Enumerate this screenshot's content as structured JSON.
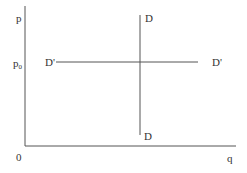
{
  "diagram": {
    "axes": {
      "y_label": "p",
      "x_label": "q",
      "origin_label": "0",
      "y_tick_label": "p",
      "y_tick_subscript": "0"
    },
    "curves": {
      "vertical_demand": {
        "top_label": "D",
        "bottom_label": "D"
      },
      "horizontal_demand": {
        "left_label": "D'",
        "right_label": "D'"
      }
    },
    "colors": {
      "line": "#555555",
      "text": "#333333"
    }
  }
}
